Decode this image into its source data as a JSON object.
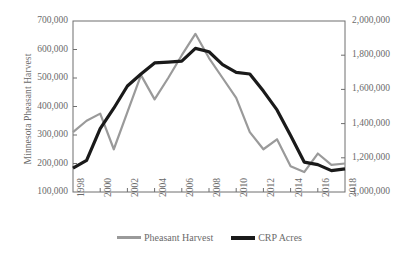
{
  "chart_data": {
    "type": "line",
    "title": "",
    "xlabel": "",
    "ylabel": "Minnesota Pheasant Harvest",
    "y2label": "CRP Acres",
    "grid": false,
    "legend_position": "bottom-center",
    "x": [
      1998,
      1999,
      2000,
      2001,
      2002,
      2003,
      2004,
      2005,
      2006,
      2007,
      2008,
      2009,
      2010,
      2011,
      2012,
      2013,
      2014,
      2015,
      2016,
      2017,
      2018
    ],
    "xlim": [
      1998,
      2018
    ],
    "ylim": [
      100000,
      700000
    ],
    "y2lim": [
      1000000,
      2000000
    ],
    "ytick_labels": [
      "700,000",
      "600,000",
      "500,000",
      "400,000",
      "300,000",
      "200,000",
      "100,000"
    ],
    "ytick_values": [
      700000,
      600000,
      500000,
      400000,
      300000,
      200000,
      100000
    ],
    "y2tick_labels": [
      "2,000,000",
      "1,800,000",
      "1,600,000",
      "1,400,000",
      "1,200,000",
      "1,000,000"
    ],
    "y2tick_values": [
      2000000,
      1800000,
      1600000,
      1400000,
      1200000,
      1000000
    ],
    "xtick_labels": [
      "1998",
      "2000",
      "2002",
      "2004",
      "2006",
      "2008",
      "2010",
      "2012",
      "2014",
      "2016",
      "2018"
    ],
    "xtick_values": [
      1998,
      2000,
      2002,
      2004,
      2006,
      2008,
      2010,
      2012,
      2014,
      2016,
      2018
    ],
    "series": [
      {
        "name": "Pheasant Harvest",
        "axis": "left",
        "color": "#9a9a9a",
        "width": 2.2,
        "values": [
          310000,
          350000,
          375000,
          250000,
          380000,
          510000,
          425000,
          500000,
          580000,
          655000,
          570000,
          500000,
          430000,
          310000,
          250000,
          285000,
          190000,
          170000,
          235000,
          195000,
          200000
        ]
      },
      {
        "name": "CRP Acres",
        "axis": "right",
        "color": "#1a1a1a",
        "width": 3.2,
        "values": [
          1140000,
          1185000,
          1370000,
          1490000,
          1620000,
          1690000,
          1755000,
          1760000,
          1765000,
          1840000,
          1820000,
          1745000,
          1700000,
          1690000,
          1590000,
          1480000,
          1330000,
          1175000,
          1160000,
          1125000,
          1135000
        ]
      }
    ]
  },
  "legend": {
    "entries": [
      {
        "label": "Pheasant Harvest",
        "swatch": "harvest"
      },
      {
        "label": "CRP Acres",
        "swatch": "crp"
      }
    ]
  },
  "caption": {
    "text": ""
  }
}
